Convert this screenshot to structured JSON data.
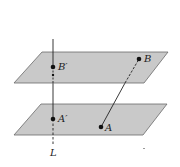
{
  "diagram": {
    "colors": {
      "plane_fill": "#c9c9c9",
      "plane_edge": "#6a6a6a",
      "line": "#222222",
      "point": "#111111"
    },
    "planes": [
      {
        "name": "upper-plane",
        "points": [
          [
            42,
            52
          ],
          [
            168,
            52
          ],
          [
            144,
            83
          ],
          [
            14,
            83
          ]
        ]
      },
      {
        "name": "lower-plane",
        "points": [
          [
            41,
            104
          ],
          [
            167,
            104
          ],
          [
            143,
            135
          ],
          [
            14,
            135
          ]
        ]
      }
    ],
    "points": [
      {
        "name": "B-prime",
        "label": "B′",
        "x": 53,
        "y": 67
      },
      {
        "name": "A-prime",
        "label": "A′",
        "x": 53,
        "y": 119
      },
      {
        "name": "B",
        "label": "B",
        "x": 139,
        "y": 59
      },
      {
        "name": "A",
        "label": "A",
        "x": 101,
        "y": 127
      }
    ],
    "line_L": {
      "label": "L",
      "x": 53,
      "y_top": 39,
      "y_bottom": 146
    },
    "labels": {
      "L": "L",
      "A": "A",
      "B": "B",
      "A_prime": "A′",
      "B_prime": "B′"
    }
  }
}
